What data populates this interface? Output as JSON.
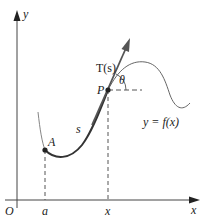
{
  "diagram": {
    "axes": {
      "x_label": "x",
      "y_label": "y",
      "origin_label": "O"
    },
    "points": [
      {
        "name": "A",
        "label": "A"
      },
      {
        "name": "P",
        "label": "P"
      }
    ],
    "tick_labels": {
      "a": "a",
      "x": "x"
    },
    "arc_length_label": "s",
    "tangent_label": "T(s)",
    "angle_label": "θ",
    "curve_label": "y = f(x)",
    "colors": {
      "curve": "#333333",
      "tangent": "#555555",
      "axis": "#444444",
      "dashed": "#555555"
    }
  }
}
